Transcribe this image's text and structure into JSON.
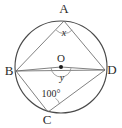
{
  "figure": {
    "background_color": "#ffffff",
    "stroke_color": "#4a4a4a",
    "chord_color": "#6a6a6a",
    "text_color": "#2b2b2b",
    "width": 122,
    "height": 128
  },
  "circle": {
    "center_label": "O",
    "center_x": 61,
    "center_y": 67,
    "radius": 46
  },
  "vertices": [
    {
      "id": "A",
      "label": "A",
      "x": 64,
      "y": 21,
      "label_x": 64,
      "label_y": 13
    },
    {
      "id": "B",
      "label": "B",
      "x": 16,
      "y": 71,
      "label_x": 9,
      "label_y": 75
    },
    {
      "id": "C",
      "label": "C",
      "x": 48,
      "y": 112,
      "label_x": 47,
      "label_y": 124
    },
    {
      "id": "D",
      "label": "D",
      "x": 105,
      "y": 70,
      "label_x": 112,
      "label_y": 74
    }
  ],
  "segments": [
    {
      "name": "chord-AB",
      "from": "A",
      "to": "B"
    },
    {
      "name": "chord-AD",
      "from": "A",
      "to": "D"
    },
    {
      "name": "chord-BD",
      "from": "B",
      "to": "D"
    },
    {
      "name": "chord-BC",
      "from": "B",
      "to": "C"
    },
    {
      "name": "chord-CD",
      "from": "C",
      "to": "D"
    },
    {
      "name": "radius-OB",
      "from": "O",
      "to": "B"
    },
    {
      "name": "radius-OD",
      "from": "O",
      "to": "D"
    }
  ],
  "angles": [
    {
      "name": "angle-at-A",
      "vertex": "A",
      "label": "x",
      "type": "variable",
      "label_x": 64,
      "label_y": 35
    },
    {
      "name": "angle-at-O",
      "vertex": "O",
      "label": "y",
      "type": "variable",
      "label_x": 62,
      "label_y": 80
    },
    {
      "name": "angle-at-C",
      "vertex": "C",
      "label": "100°",
      "type": "value",
      "label_x": 51,
      "label_y": 97
    }
  ]
}
